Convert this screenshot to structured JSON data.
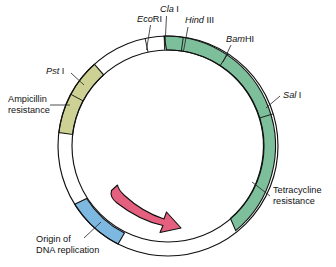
{
  "figure": {
    "name": "plasmid-map",
    "center": {
      "x": 168,
      "y": 146
    },
    "radius_outer": 110,
    "radius_inner": 96,
    "background": "#ffffff",
    "outline_color": "#111111"
  },
  "segments": [
    {
      "id": "tetracycline-resistance",
      "label": "Tetracycline\nresistance",
      "label_line1": "Tetracycline",
      "label_line2": "resistance",
      "color": "#7dbf9a",
      "start_deg": 92,
      "end_deg": -52,
      "label_x": 274,
      "label_y": 199,
      "leader": {
        "x1": 271,
        "y1": 196,
        "x2": 253,
        "y2": 182
      }
    },
    {
      "id": "ampicillin-resistance",
      "label": "Ampicillin\nresistance",
      "label_line1": "Ampicillin",
      "label_line2": "resistance",
      "color": "#cdd194",
      "start_deg": 173,
      "end_deg": 132,
      "label_x": 8,
      "label_y": 103,
      "leader": {
        "x1": 52,
        "y1": 107,
        "x2": 69,
        "y2": 107
      }
    },
    {
      "id": "origin-of-dna-replication",
      "label": "Origin of\nDNA replication",
      "label_line1": "Origin of",
      "label_line2": "DNA replication",
      "color": "#7db8e0",
      "start_deg": 243,
      "end_deg": 212,
      "label_x": 36,
      "label_y": 240,
      "leader": {
        "x1": 84,
        "y1": 237,
        "x2": 99,
        "y2": 224
      }
    }
  ],
  "restriction_sites": [
    {
      "id": "ecori",
      "name_italic": "Eco",
      "name_roman": "RI",
      "angle_deg": 102,
      "label_x": 137,
      "label_y": 20,
      "leader": {
        "x1": 157,
        "y1": 23,
        "x2": 165,
        "y2": 54
      }
    },
    {
      "id": "clai",
      "name_italic": "Cla",
      "name_roman": " I",
      "angle_deg": 92,
      "label_x": 163,
      "label_y": 11,
      "leader": {
        "x1": 172,
        "y1": 14,
        "x2": 172,
        "y2": 52
      }
    },
    {
      "id": "hindiii",
      "name_italic": "Hind",
      "name_roman": " III",
      "angle_deg": 82,
      "label_x": 186,
      "label_y": 21,
      "leader": {
        "x1": 192,
        "y1": 25,
        "x2": 185,
        "y2": 54
      }
    },
    {
      "id": "bamhi",
      "name_italic": "Bam",
      "name_roman": "HI",
      "angle_deg": 57,
      "label_x": 229,
      "label_y": 40,
      "leader": {
        "x1": 232,
        "y1": 44,
        "x2": 216,
        "y2": 69
      }
    },
    {
      "id": "sali",
      "name_italic": "Sal",
      "name_roman": " I",
      "angle_deg": 17,
      "label_x": 284,
      "label_y": 95,
      "leader": {
        "x1": 281,
        "y1": 97,
        "x2": 262,
        "y2": 106
      }
    },
    {
      "id": "psti",
      "name_italic": "Pst",
      "name_roman": " I",
      "angle_deg": 152,
      "label_x": 47,
      "label_y": 72,
      "leader": {
        "x1": 70,
        "y1": 74,
        "x2": 86,
        "y2": 88
      }
    }
  ],
  "replication_arrow": {
    "id": "replication-direction-arrow",
    "color": "#e4607e",
    "outline": "#111111",
    "description": "curved arrow indicating direction of replication"
  }
}
